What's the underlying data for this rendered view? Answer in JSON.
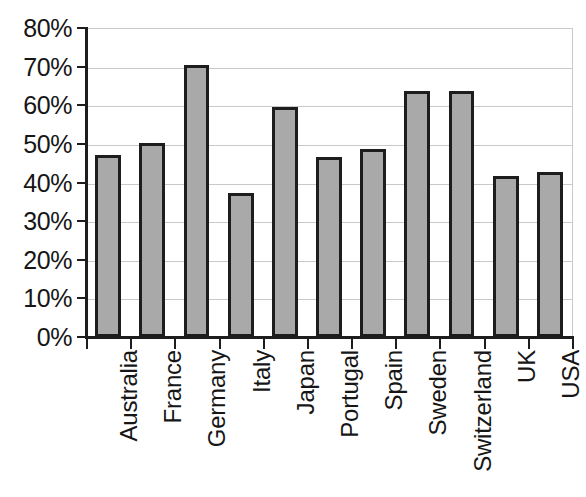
{
  "chart_data": {
    "type": "bar",
    "title": "",
    "subtitle": "",
    "xlabel": "",
    "ylabel": "",
    "categories": [
      "Australia",
      "France",
      "Germany",
      "Italy",
      "Japan",
      "Portugal",
      "Spain",
      "Sweden",
      "Switzerland",
      "UK",
      "USA"
    ],
    "values": [
      47.2,
      50.2,
      70.3,
      37.4,
      59.5,
      46.5,
      48.6,
      63.7,
      63.8,
      41.8,
      42.8
    ],
    "value_unit": "%",
    "ylim": [
      0,
      80
    ],
    "ytick_step": 10,
    "ytick_labels": [
      "0%",
      "10%",
      "20%",
      "30%",
      "40%",
      "50%",
      "60%",
      "70%",
      "80%"
    ],
    "ytick_values": [
      0,
      10,
      20,
      30,
      40,
      50,
      60,
      70,
      80
    ],
    "grid": true,
    "grid_axis": "y",
    "legend": false,
    "legend_position": "none",
    "series": [
      {
        "name": "Series 1",
        "values": [
          47.2,
          50.2,
          70.3,
          37.4,
          59.5,
          46.5,
          48.6,
          63.7,
          63.8,
          41.8,
          42.8
        ]
      }
    ],
    "colors": {
      "bar_fill": "#a9a9a9",
      "bar_border": "#1d1d1d",
      "gridline": "#c9c9c9",
      "axis": "#1d1d1d",
      "text": "#161616",
      "background": "#ffffff"
    }
  }
}
